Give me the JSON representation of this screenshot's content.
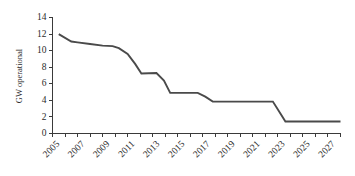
{
  "chart_data": {
    "type": "line",
    "title": "",
    "xlabel": "",
    "ylabel": "GW operational",
    "xlim": [
      2005,
      2028
    ],
    "ylim": [
      0,
      14
    ],
    "grid": false,
    "legend": null,
    "y_ticks": [
      0,
      2,
      4,
      6,
      8,
      10,
      12,
      14
    ],
    "y_tick_labels": [
      "0",
      "2",
      "4",
      "6",
      "8",
      "10",
      "12",
      "14"
    ],
    "x_ticks": [
      2005,
      2006,
      2007,
      2008,
      2009,
      2010,
      2011,
      2012,
      2013,
      2014,
      2015,
      2016,
      2017,
      2018,
      2019,
      2020,
      2021,
      2022,
      2023,
      2024,
      2025,
      2026,
      2027,
      2028
    ],
    "x_tick_labels_shown": [
      "2005",
      "2007",
      "2009",
      "2011",
      "2013",
      "2015",
      "2017",
      "2019",
      "2021",
      "2023",
      "2025",
      "2027"
    ],
    "x_tick_label_years": [
      2005,
      2007,
      2009,
      2011,
      2013,
      2015,
      2017,
      2019,
      2021,
      2023,
      2025,
      2027
    ],
    "x": [
      2005.5,
      2006.5,
      2007.0,
      2008.0,
      2009.0,
      2009.8,
      2010.3,
      2011.0,
      2011.6,
      2012.1,
      2013.3,
      2013.9,
      2014.4,
      2016.6,
      2017.2,
      2017.8,
      2022.6,
      2023.2,
      2023.6,
      2028.0
    ],
    "y": [
      12.0,
      11.1,
      11.0,
      10.8,
      10.6,
      10.55,
      10.3,
      9.6,
      8.4,
      7.25,
      7.3,
      6.4,
      4.9,
      4.9,
      4.45,
      3.85,
      3.85,
      2.4,
      1.45,
      1.45
    ],
    "series": [
      {
        "name": "GW operational",
        "color": "#4a4a4a",
        "points": [
          {
            "year": 2005.5,
            "value": 12.0
          },
          {
            "year": 2006.5,
            "value": 11.1
          },
          {
            "year": 2007.0,
            "value": 11.0
          },
          {
            "year": 2008.0,
            "value": 10.8
          },
          {
            "year": 2009.0,
            "value": 10.6
          },
          {
            "year": 2009.8,
            "value": 10.55
          },
          {
            "year": 2010.3,
            "value": 10.3
          },
          {
            "year": 2011.0,
            "value": 9.6
          },
          {
            "year": 2011.6,
            "value": 8.4
          },
          {
            "year": 2012.1,
            "value": 7.25
          },
          {
            "year": 2013.3,
            "value": 7.3
          },
          {
            "year": 2013.9,
            "value": 6.4
          },
          {
            "year": 2014.4,
            "value": 4.9
          },
          {
            "year": 2016.6,
            "value": 4.9
          },
          {
            "year": 2017.2,
            "value": 4.45
          },
          {
            "year": 2017.8,
            "value": 3.85
          },
          {
            "year": 2022.6,
            "value": 3.85
          },
          {
            "year": 2023.2,
            "value": 2.4
          },
          {
            "year": 2023.6,
            "value": 1.45
          },
          {
            "year": 2028.0,
            "value": 1.45
          }
        ]
      }
    ],
    "colors": {
      "line": "#4a4a4a",
      "axis": "#3a3a3a",
      "text": "#2b2b2b",
      "background": "#ffffff"
    }
  }
}
